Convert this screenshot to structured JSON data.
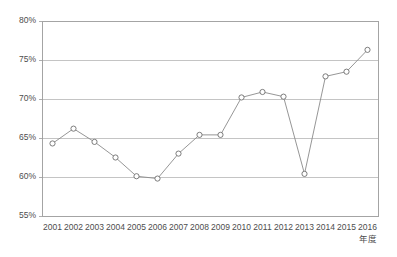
{
  "chart_data": {
    "type": "line",
    "title": "",
    "subtitle": "",
    "xlabel": "年度",
    "ylabel": "",
    "x": [
      "2001",
      "2002",
      "2003",
      "2004",
      "2005",
      "2006",
      "2007",
      "2008",
      "2009",
      "2010",
      "2011",
      "2012",
      "2013",
      "2014",
      "2015",
      "2016"
    ],
    "categories": [
      "2001",
      "2002",
      "2003",
      "2004",
      "2005",
      "2006",
      "2007",
      "2008",
      "2009",
      "2010",
      "2011",
      "2012",
      "2013",
      "2014",
      "2015",
      "2016"
    ],
    "values": [
      64.3,
      66.2,
      64.5,
      62.5,
      60.1,
      59.8,
      63.0,
      65.4,
      65.4,
      70.2,
      70.9,
      70.3,
      60.4,
      72.9,
      73.5,
      76.3
    ],
    "series": [
      {
        "name": "",
        "values": [
          64.3,
          66.2,
          64.5,
          62.5,
          60.1,
          59.8,
          63.0,
          65.4,
          65.4,
          70.2,
          70.9,
          70.3,
          60.4,
          72.9,
          73.5,
          76.3
        ]
      }
    ],
    "ylim": [
      55,
      80
    ],
    "yticks": [
      55,
      60,
      65,
      70,
      75,
      80
    ],
    "ytick_labels": [
      "55%",
      "60%",
      "65%",
      "70%",
      "75%",
      "80%"
    ],
    "xtick_labels": [
      "2001",
      "2002",
      "2003",
      "2004",
      "2005",
      "2006",
      "2007",
      "2008",
      "2009",
      "2010",
      "2011",
      "2012",
      "2013",
      "2014",
      "2015",
      "2016"
    ],
    "grid": true,
    "grid_axis": "y",
    "legend": false,
    "legend_position": "none",
    "marker": "circle-open",
    "annotations": []
  },
  "style": {
    "background": "#ffffff",
    "grid_color": "#b5b5b5",
    "border_color": "#9a9a9a",
    "line_color": "#8a8a8a",
    "marker_fill": "#ffffff",
    "marker_stroke": "#6e6e6e",
    "text_color": "#4d4d4d"
  },
  "geometry": {
    "plot_left": 42,
    "plot_right": 378,
    "plot_top": 21,
    "plot_bottom": 216
  }
}
